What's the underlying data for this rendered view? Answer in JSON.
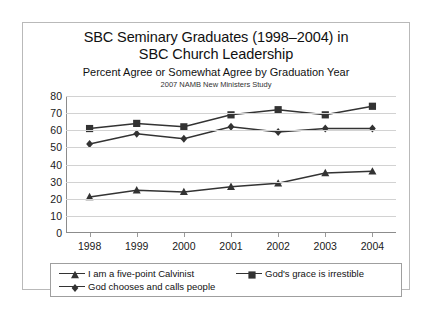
{
  "chart_data": {
    "type": "line",
    "title": "SBC Seminary Graduates (1998–2004) in SBC Church Leadership",
    "title_line1": "SBC Seminary Graduates (1998–2004) in",
    "title_line2": "SBC Church Leadership",
    "subtitle": "Percent Agree or Somewhat Agree by Graduation Year",
    "source_note": "2007 NAMB New Ministers Study",
    "xlabel": "",
    "ylabel": "",
    "categories": [
      "1998",
      "1999",
      "2000",
      "2001",
      "2002",
      "2003",
      "2004"
    ],
    "ylim": [
      0,
      80
    ],
    "yticks": [
      0,
      10,
      20,
      30,
      40,
      50,
      60,
      70,
      80
    ],
    "grid": true,
    "legend_position": "bottom",
    "series": [
      {
        "name": "I am a five-point Calvinist",
        "marker": "triangle",
        "color": "#333333",
        "values": [
          21,
          25,
          24,
          27,
          29,
          35,
          36
        ]
      },
      {
        "name": "God's grace is irrestible",
        "marker": "square",
        "color": "#333333",
        "values": [
          61,
          64,
          62,
          69,
          72,
          69,
          74
        ]
      },
      {
        "name": "God chooses and calls people",
        "marker": "diamond",
        "color": "#333333",
        "values": [
          52,
          58,
          55,
          62,
          59,
          61,
          61
        ]
      }
    ]
  },
  "colors": {
    "line": "#3a3a3a",
    "grid": "#d2d2d2",
    "axis": "#8c8c8c",
    "frame": "#b9b9b9",
    "text": "#1a1a1a"
  }
}
